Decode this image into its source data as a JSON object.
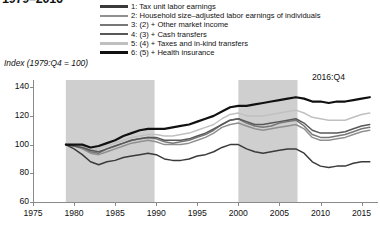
{
  "title": "1979–2016",
  "ylabel": "Index (1979:Q4 = 100)",
  "annotation": "2016:Q4",
  "legend": {
    "items": [
      {
        "label": "1: Tax unit labor earnings",
        "color": "#3a3a3a",
        "width": 2.8
      },
      {
        "label": "2: Household size–adjusted labor earnings of individuals",
        "color": "#909090",
        "width": 2.4
      },
      {
        "label": "3: (2) + Other market income",
        "color": "#777777",
        "width": 2.4
      },
      {
        "label": "4: (3) + Cash transfers",
        "color": "#585858",
        "width": 2.4
      },
      {
        "label": "5: (4) + Taxes and in-kind transfers",
        "color": "#c0c0c0",
        "width": 2.4
      },
      {
        "label": "6: (5) + Health insurance",
        "color": "#111111",
        "width": 3.0
      }
    ]
  },
  "chart_data": {
    "type": "line",
    "title": "1979–2016",
    "xlabel": "",
    "ylabel": "Index (1979:Q4 = 100)",
    "xlim": [
      1975,
      2017
    ],
    "ylim": [
      60,
      145
    ],
    "yticks": [
      60,
      80,
      100,
      120,
      140
    ],
    "xticks": [
      1975,
      1980,
      1985,
      1990,
      1995,
      2000,
      2005,
      2010,
      2015
    ],
    "grid": false,
    "legend_position": "top",
    "annotations": [
      {
        "text": "2016:Q4",
        "x": 2014,
        "y": 141
      }
    ],
    "shaded_bands": [
      {
        "x0": 1979.0,
        "x1": 1989.8,
        "color": "#cfcfcf",
        "label": "shaded period 1"
      },
      {
        "x0": 2000.0,
        "x1": 2007.2,
        "color": "#cfcfcf",
        "label": "shaded period 2"
      }
    ],
    "x": [
      1979,
      1980,
      1981,
      1982,
      1983,
      1984,
      1985,
      1986,
      1987,
      1988,
      1989,
      1990,
      1991,
      1992,
      1993,
      1994,
      1995,
      1996,
      1997,
      1998,
      1999,
      2000,
      2001,
      2002,
      2003,
      2004,
      2005,
      2006,
      2007,
      2008,
      2009,
      2010,
      2011,
      2012,
      2013,
      2014,
      2015,
      2016
    ],
    "series": [
      {
        "name": "1: Tax unit labor earnings",
        "color": "#3a3a3a",
        "values": [
          100,
          97,
          93,
          88,
          86,
          88,
          89,
          91,
          92,
          93,
          94,
          93,
          90,
          89,
          89,
          90,
          92,
          93,
          95,
          98,
          100,
          100,
          97,
          95,
          94,
          95,
          96,
          97,
          97,
          94,
          88,
          85,
          84,
          85,
          85,
          87,
          88,
          88
        ]
      },
      {
        "name": "2: Household size–adjusted labor earnings of individuals",
        "color": "#909090",
        "values": [
          100,
          99,
          97,
          94,
          93,
          95,
          97,
          99,
          101,
          102,
          103,
          102,
          100,
          100,
          100,
          101,
          103,
          105,
          108,
          112,
          114,
          115,
          113,
          111,
          110,
          111,
          112,
          113,
          114,
          111,
          105,
          103,
          103,
          104,
          105,
          107,
          109,
          110
        ]
      },
      {
        "name": "3: (2) + Other market income",
        "color": "#777777",
        "values": [
          100,
          99,
          98,
          95,
          94,
          97,
          99,
          101,
          103,
          104,
          105,
          104,
          102,
          101,
          102,
          103,
          105,
          107,
          110,
          114,
          117,
          118,
          115,
          113,
          112,
          113,
          115,
          116,
          117,
          113,
          107,
          105,
          105,
          106,
          107,
          109,
          111,
          112
        ]
      },
      {
        "name": "4: (3) + Cash transfers",
        "color": "#585858",
        "values": [
          100,
          99,
          98,
          96,
          95,
          97,
          99,
          101,
          103,
          104,
          105,
          105,
          103,
          103,
          103,
          104,
          106,
          108,
          111,
          114,
          117,
          118,
          116,
          114,
          114,
          115,
          116,
          117,
          118,
          115,
          110,
          108,
          108,
          108,
          109,
          111,
          113,
          114
        ]
      },
      {
        "name": "5: (4) + Taxes and in-kind transfers",
        "color": "#c0c0c0",
        "values": [
          100,
          100,
          99,
          97,
          97,
          99,
          101,
          103,
          105,
          106,
          107,
          107,
          106,
          106,
          107,
          108,
          110,
          112,
          114,
          118,
          121,
          122,
          120,
          120,
          120,
          121,
          122,
          123,
          124,
          122,
          119,
          118,
          117,
          117,
          117,
          119,
          121,
          122
        ]
      },
      {
        "name": "6: (5) + Health insurance",
        "color": "#111111",
        "values": [
          100,
          100,
          100,
          98,
          99,
          101,
          103,
          106,
          108,
          110,
          111,
          111,
          111,
          112,
          113,
          114,
          116,
          118,
          120,
          123,
          126,
          127,
          127,
          128,
          129,
          130,
          131,
          132,
          133,
          132,
          130,
          130,
          129,
          130,
          130,
          131,
          132,
          133
        ]
      }
    ]
  }
}
